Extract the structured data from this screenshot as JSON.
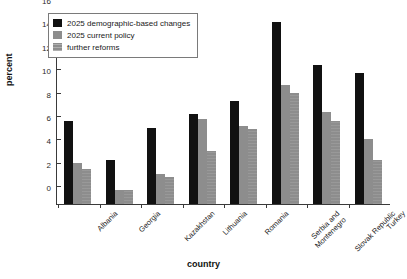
{
  "chart_data": {
    "type": "bar",
    "title": "",
    "xlabel": "country",
    "ylabel": "percent",
    "ylim": [
      0,
      16
    ],
    "yticks": [
      0,
      2,
      4,
      6,
      8,
      10,
      12,
      14,
      16
    ],
    "grid": false,
    "legend_position": "top-left",
    "categories": [
      "Albania",
      "Georgia",
      "Kazakhstan",
      "Lithuania",
      "Romania",
      "Serbia and\nMontenegro",
      "Slovak Republic",
      "Turkey"
    ],
    "series": [
      {
        "name": "2025 demographic-based changes",
        "color": "#111111",
        "values": [
          7.1,
          3.8,
          6.5,
          7.7,
          8.8,
          15.6,
          11.9,
          11.2
        ]
      },
      {
        "name": "2025 current policy",
        "color": "#8d8d8d",
        "values": [
          3.5,
          1.2,
          2.6,
          7.3,
          6.7,
          10.2,
          7.9,
          5.6
        ]
      },
      {
        "name": "further reforms",
        "color": "#8d8d8d",
        "values": [
          3.0,
          1.2,
          2.3,
          4.5,
          6.4,
          9.5,
          7.1,
          3.8
        ]
      }
    ]
  },
  "legend": {
    "items": [
      {
        "label": "2025 demographic-based changes",
        "swatch": "black-square-icon"
      },
      {
        "label": "2025 current policy",
        "swatch": "gray-square-icon"
      },
      {
        "label": "further reforms",
        "swatch": "gray-hatched-square-icon"
      }
    ]
  },
  "axes": {
    "y_title": "percent",
    "x_title": "country",
    "y_tick_labels": [
      "0",
      "2",
      "4",
      "6",
      "8",
      "10",
      "12",
      "14",
      "16"
    ]
  }
}
